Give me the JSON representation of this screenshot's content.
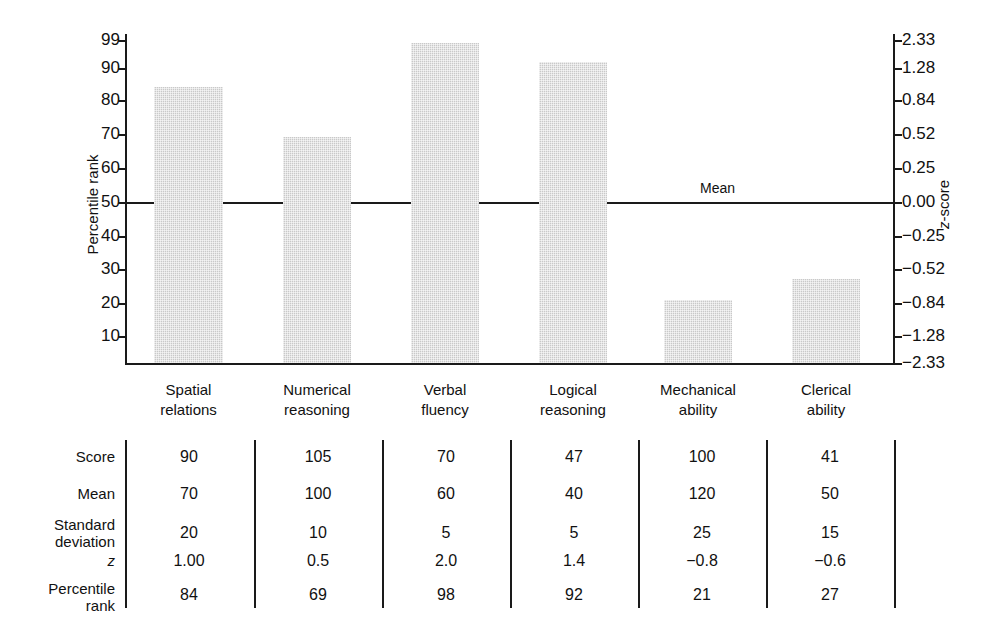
{
  "chart_data": {
    "type": "bar",
    "title": "",
    "xlabel": "",
    "ylabel": "Percentile rank",
    "y2label": "z-score",
    "categories": [
      "Spatial relations",
      "Numerical reasoning",
      "Verbal fluency",
      "Logical reasoning",
      "Mechanical ability",
      "Clerical ability"
    ],
    "category_lines": [
      [
        "Spatial",
        "relations"
      ],
      [
        "Numerical",
        "reasoning"
      ],
      [
        "Verbal",
        "fluency"
      ],
      [
        "Logical",
        "reasoning"
      ],
      [
        "Mechanical",
        "ability"
      ],
      [
        "Clerical",
        "ability"
      ]
    ],
    "values": [
      84,
      69,
      98,
      92,
      21,
      27
    ],
    "ylim": [
      0,
      100
    ],
    "grid": false,
    "legend": null,
    "annotations": [
      {
        "text": "Mean",
        "y_percentile": 50,
        "z": 0.0
      }
    ],
    "left_axis": {
      "label": "Percentile rank",
      "ticks": [
        99,
        90,
        80,
        70,
        60,
        50,
        40,
        30,
        20,
        10
      ],
      "tick_labels": [
        "99",
        "90",
        "80",
        "70",
        "60",
        "50",
        "40",
        "30",
        "20",
        "10"
      ]
    },
    "right_axis": {
      "label": "z-score",
      "tick_labels": [
        "2.33",
        "1.28",
        "0.84",
        "0.52",
        "0.25",
        "0.00",
        "−0.25",
        "−0.52",
        "−0.84",
        "−1.28",
        "−2.33"
      ],
      "tick_values": [
        2.33,
        1.28,
        0.84,
        0.52,
        0.25,
        0.0,
        -0.25,
        -0.52,
        -0.84,
        -1.28,
        -2.33
      ]
    },
    "bar_color": "#c9c9c9",
    "axis_color": "#1a1a1a"
  },
  "table": {
    "row_labels": [
      "Score",
      "Mean",
      "Standard deviation",
      "z",
      "Percentile rank"
    ],
    "row_label_lines": [
      [
        "Score"
      ],
      [
        "Mean"
      ],
      [
        "Standard",
        "deviation"
      ],
      [
        "z"
      ],
      [
        "Percentile",
        "rank"
      ]
    ],
    "rows": [
      {
        "label": "Score",
        "values": [
          "90",
          "105",
          "70",
          "47",
          "100",
          "41"
        ]
      },
      {
        "label": "Mean",
        "values": [
          "70",
          "100",
          "60",
          "40",
          "120",
          "50"
        ]
      },
      {
        "label": "Standard deviation",
        "values": [
          "20",
          "10",
          "5",
          "5",
          "25",
          "15"
        ]
      },
      {
        "label": "z",
        "values": [
          "1.00",
          "0.5",
          "2.0",
          "1.4",
          "−0.8",
          "−0.6"
        ]
      },
      {
        "label": "Percentile rank",
        "values": [
          "84",
          "69",
          "98",
          "92",
          "21",
          "27"
        ]
      }
    ]
  }
}
